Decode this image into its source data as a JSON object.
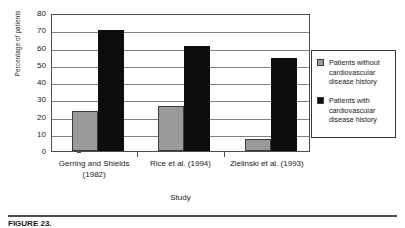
{
  "chart_data": {
    "type": "bar",
    "title": "",
    "xlabel": "Study",
    "ylabel": "Percentage of patients",
    "categories": [
      "Gerring and Shields (1982)",
      "Rice et al. (1994)",
      "Zielinski et al. (1993)"
    ],
    "series": [
      {
        "name": "Patients without cardiovascular disease history",
        "values": [
          23,
          26,
          7
        ],
        "color": "#9a9a9a"
      },
      {
        "name": "Patients with cardiovascular disease history",
        "values": [
          70,
          61,
          54
        ],
        "color": "#0d0d0d"
      }
    ],
    "ylim": [
      0,
      80
    ],
    "ytick_labels": [
      "80",
      "70",
      "60",
      "50",
      "40",
      "30",
      "20",
      "10",
      "0"
    ],
    "ytick_values": [
      80,
      70,
      60,
      50,
      40,
      30,
      20,
      10,
      0
    ],
    "grid": true,
    "legend_position": "right"
  },
  "axes": {
    "y_title": "Percentage of patients",
    "x_title": "Study"
  },
  "legend": {
    "items": [
      {
        "label": "Patients without cardiovascular disease history",
        "swatch": "gray-swatch"
      },
      {
        "label": "Patients with cardiovascular disease history",
        "swatch": "black-swatch"
      }
    ]
  },
  "caption": {
    "text": "FIGURE 23. "
  }
}
